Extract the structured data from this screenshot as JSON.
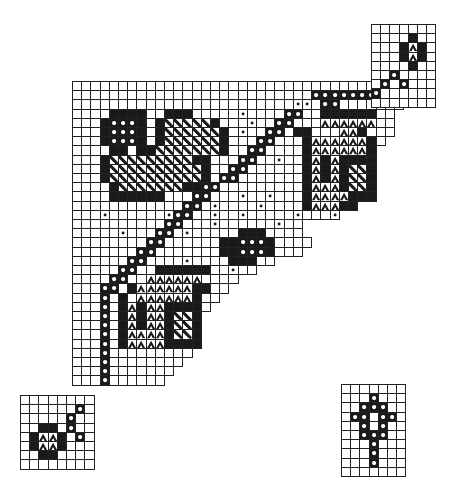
{
  "title": "Filet / knitting chart with motifs",
  "cell_size": 9.2,
  "legend_symbols": {
    ".": "empty",
    "X": "filled",
    "o": "open-circle",
    "d": "small-dot",
    "A": "arch-triangle",
    "/": "diagonal-hatch"
  },
  "colors": {
    "ink": "#1a1a1a",
    "paper": "#ffffff",
    "line": "#222222"
  },
  "charts": [
    {
      "name": "main-triangle-chart",
      "x": 72,
      "y": 81,
      "rows": [
        "...................................",
        "..........................oooooooooo",
        "........................dd.oo.......",
        "....XXXX..XXX.....d....oo..XXXXXX..",
        "...XoooX.X/////X...d..oo...AAAAAA..",
        "...XoooX.X//////X.d..oo.XX...AAX...",
        "...XoooX.X//////X...oo...XAAAAAAX.",
        "....XX.XX///////X..oo....XAAAAAAX",
        "...X/////////XX...oo..d..XAXAXXXX",
        "...X//////////X..oo......XAXAX//X",
        "...X//////////X.oo.......XAXAX//X",
        "....X///////XXoo.........XAAAX//X",
        "....XXXXXX...oo...d..d...XAAAAXXX",
        "............oo.d....d....XAAAXX",
        "...d......doo..d..d.....d...d",
        "..........oo...d......d..",
        ".....d...oo.d.....XXX....",
        "........oo......XXoooX....",
        ".......oo.......XXoooX...",
        "......oo....d....XXX..",
        ".....oo..XXXXXX..d..",
        "....oo..AAAAAA....",
        "...oo.XAAAAAAXX..",
        "...o.X.AAAAAAX..",
        "...o.XAXAAXXXX.",
        "...o.XAXAAX//X",
        "...o.XAXAAX//X",
        "...o.XAAAAX//X",
        "...o.XAAAAXXXX",
        "...o.........",
        "...o........",
        "...o.......",
        "...o......"
      ]
    },
    {
      "name": "top-right-corner-chart",
      "x": 371,
      "y": 24,
      "rows": [
        ".......",
        "....X..",
        "...XAX.",
        "...XAX.",
        "....X..",
        "..o....",
        ".o.o...",
        "o......",
        "......."
      ]
    },
    {
      "name": "bottom-left-corner-chart",
      "x": 20,
      "y": 395,
      "rows": [
        "........",
        "......o.",
        ".....o..",
        "..XX.o..",
        ".XAAX.o.",
        ".XAAX...",
        "..XX....",
        "........"
      ]
    },
    {
      "name": "cross-motif-chart",
      "x": 341,
      "y": 384,
      "rows": [
        ".......",
        "...o...",
        "..ooo..",
        ".oo.oo.",
        "..o.o..",
        "..ooo..",
        "...o...",
        "...o...",
        "...o...",
        "......."
      ]
    }
  ]
}
